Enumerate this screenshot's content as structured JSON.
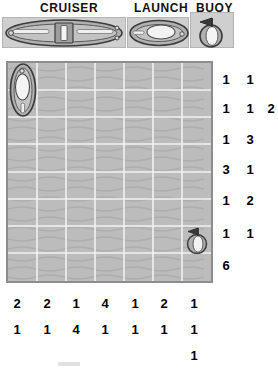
{
  "legend": {
    "items": [
      {
        "label": "CRUISER",
        "icon": "cruiser-ship-icon",
        "cells": 4
      },
      {
        "label": "LAUNCH",
        "icon": "launch-boat-icon",
        "cells": 2
      },
      {
        "label": "BUOY",
        "icon": "buoy-icon",
        "cells": 1
      }
    ]
  },
  "board": {
    "columns": 7,
    "rows": 8,
    "water_color": "#b9b9b9",
    "grid_line_color": "#f2f2f2",
    "border_color": "#8d8d8d",
    "pieces": [
      {
        "type": "launch-boat-icon",
        "col": 0,
        "row": 0,
        "orientation": "vertical"
      },
      {
        "type": "buoy-icon",
        "col": 6,
        "row": 6,
        "orientation": "none"
      }
    ]
  },
  "row_clues": [
    [
      "1",
      "1"
    ],
    [
      "1",
      "1",
      "2"
    ],
    [
      "1",
      "3"
    ],
    [
      "3",
      "1"
    ],
    [
      "1",
      "2"
    ],
    [
      "1",
      "1"
    ],
    [
      "6"
    ]
  ],
  "col_clues": [
    [
      "2",
      "1"
    ],
    [
      "2",
      "1"
    ],
    [
      "1",
      "4"
    ],
    [
      "4",
      "1"
    ],
    [
      "1",
      "1"
    ],
    [
      "2",
      "1"
    ],
    [
      "1",
      "1",
      "1"
    ]
  ]
}
